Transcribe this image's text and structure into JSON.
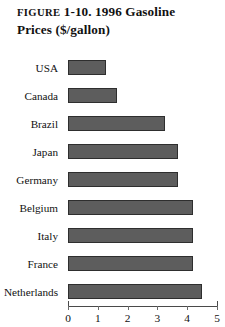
{
  "figure": {
    "label": "FIGURE",
    "number": "1-10.",
    "title_line1": "1996 Gasoline",
    "title_line2": "Prices ($/gallon)",
    "full_caption": "FIGURE 1-10.  1996 Gasoline Prices ($/gallon)"
  },
  "style": {
    "bar_fill": "#5d5d5d",
    "bar_border": "#2e2e2e",
    "axis_color": "#4a4a4a",
    "background": "#ffffff",
    "text_color": "#111111"
  },
  "axis": {
    "tick_labels": [
      "0",
      "1",
      "2",
      "3",
      "4",
      "5"
    ],
    "tick_values": [
      0,
      1,
      2,
      3,
      4,
      5
    ]
  },
  "chart_data": {
    "type": "bar",
    "orientation": "horizontal",
    "title": "FIGURE 1-10.  1996 Gasoline Prices ($/gallon)",
    "xlabel": "",
    "ylabel": "",
    "xlim": [
      0,
      5
    ],
    "grid": false,
    "legend": false,
    "categories": [
      "USA",
      "Canada",
      "Brazil",
      "Japan",
      "Germany",
      "Belgium",
      "Italy",
      "France",
      "Netherlands"
    ],
    "values": [
      1.27,
      1.65,
      3.25,
      3.7,
      3.7,
      4.2,
      4.2,
      4.2,
      4.5
    ],
    "bars": [
      {
        "category": "USA",
        "value": 1.27
      },
      {
        "category": "Canada",
        "value": 1.65
      },
      {
        "category": "Brazil",
        "value": 3.25
      },
      {
        "category": "Japan",
        "value": 3.7
      },
      {
        "category": "Germany",
        "value": 3.7
      },
      {
        "category": "Belgium",
        "value": 4.2
      },
      {
        "category": "Italy",
        "value": 4.2
      },
      {
        "category": "France",
        "value": 4.2
      },
      {
        "category": "Netherlands",
        "value": 4.5
      }
    ]
  }
}
